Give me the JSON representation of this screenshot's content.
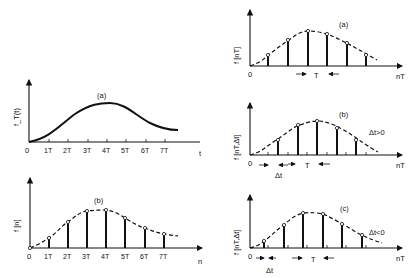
{
  "left_a": {
    "panel": "(a)",
    "ylabel": "f_T(t)",
    "xlabel": "t",
    "origin": "0",
    "ticks": [
      "1T",
      "2T",
      "3T",
      "4T",
      "5T",
      "6T",
      "7T"
    ]
  },
  "left_b": {
    "panel": "(b)",
    "ylabel": "f [n]",
    "xlabel": "n",
    "origin": "0",
    "ticks": [
      "1T",
      "2T",
      "3T",
      "4T",
      "5T",
      "6T",
      "7T"
    ]
  },
  "right_a": {
    "panel": "(a)",
    "ylabel": "f [nT]",
    "xlabel": "nT",
    "origin": "0",
    "period": "T"
  },
  "right_b": {
    "panel": "(b)",
    "ylabel": "f [nT,Δt]",
    "xlabel": "nT",
    "origin": "0",
    "period": "T",
    "shift": "Δt",
    "condition": "Δt>0"
  },
  "right_c": {
    "panel": "(c)",
    "ylabel": "f [nT,Δt]",
    "xlabel": "nT",
    "origin": "0",
    "period": "T",
    "shift": "Δt",
    "condition": "Δt<0"
  }
}
